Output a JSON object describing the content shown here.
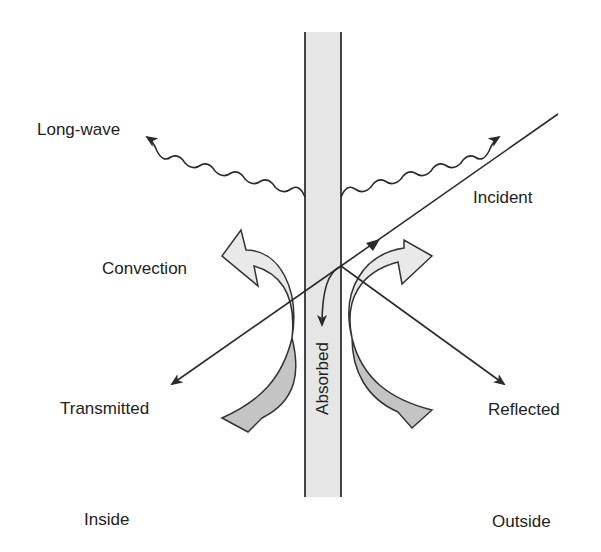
{
  "diagram": {
    "colors": {
      "wall_fill": "#e6e6e6",
      "wall_stroke": "#444444",
      "line": "#2b2b2b",
      "arrow_light": "#e9e9e9",
      "arrow_dark": "#c4c4c4",
      "text": "#222222"
    },
    "labels": {
      "long_wave": "Long-wave",
      "incident": "Incident",
      "convection": "Convection",
      "transmitted": "Transmitted",
      "reflected": "Reflected",
      "absorbed": "Absorbed",
      "inside": "Inside",
      "outside": "Outside"
    },
    "elements": [
      {
        "name": "wall",
        "kind": "vertical slab",
        "x_range": [
          305,
          341
        ],
        "y_range": [
          32,
          497
        ]
      },
      {
        "name": "incident-ray",
        "from": [
          558,
          114
        ],
        "to": [
          341,
          266
        ]
      },
      {
        "name": "transmitted-ray",
        "from": [
          341,
          266
        ],
        "to": [
          172,
          384
        ]
      },
      {
        "name": "reflected-ray",
        "from": [
          341,
          266
        ],
        "to": [
          504,
          384
        ]
      },
      {
        "name": "absorbed-arrow",
        "from": [
          341,
          266
        ],
        "to": [
          321,
          325
        ]
      },
      {
        "name": "long-wave-left",
        "from": [
          305,
          197
        ],
        "to": [
          155,
          135
        ]
      },
      {
        "name": "long-wave-right",
        "from": [
          341,
          197
        ],
        "to": [
          492,
          135
        ]
      },
      {
        "name": "convection-left",
        "side": "inside"
      },
      {
        "name": "convection-right",
        "side": "outside"
      }
    ]
  }
}
